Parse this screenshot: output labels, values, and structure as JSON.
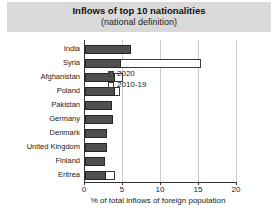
{
  "title": "Inflows of top 10 nationalities",
  "subtitle": "(national definition)",
  "chart_data": {
    "type": "bar",
    "orientation": "horizontal",
    "title": "Inflows of top 10 nationalities",
    "subtitle": "(national definition)",
    "categories": [
      "India",
      "Syria",
      "Afghanistan",
      "Poland",
      "Pakistan",
      "Germany",
      "Denmark",
      "United Kingdom",
      "Finland",
      "Eritrea"
    ],
    "series": [
      {
        "name": "2020",
        "style": "filled",
        "color": "#4f4f4f",
        "values": [
          6.1,
          4.8,
          3.9,
          3.9,
          3.6,
          3.7,
          2.9,
          2.9,
          2.6,
          2.7
        ]
      },
      {
        "name": "2010-19",
        "style": "outline",
        "color": "#ffffff",
        "values": [
          null,
          15.3,
          5.0,
          4.6,
          null,
          null,
          null,
          null,
          null,
          4.0
        ]
      }
    ],
    "xlabel": "% of total inflows of foreign population",
    "xlim": [
      0,
      20
    ],
    "xticks": [
      0,
      5,
      10,
      15,
      20
    ],
    "grid": true,
    "legend_position": "inside-right-middle"
  },
  "colors": {
    "banner_bg": "#d9d9d9",
    "bar_2020": "#4f4f4f",
    "bar_2010_19_fill": "#ffffff",
    "bar_outline": "#3a3a3a",
    "gridline": "#cccccc",
    "axis": "#333333"
  }
}
